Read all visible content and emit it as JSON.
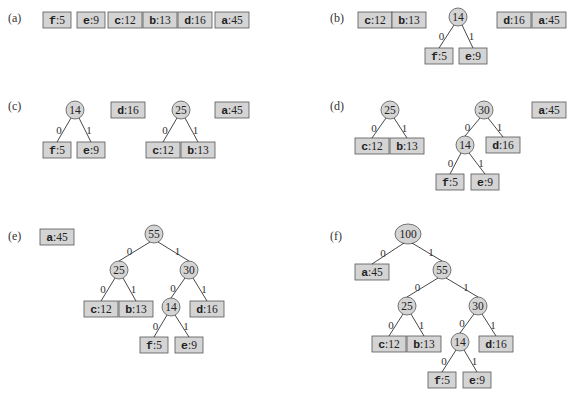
{
  "figure": {
    "panels": [
      {
        "label": "(a)",
        "x": 8,
        "y": 22
      },
      {
        "label": "(b)",
        "x": 330,
        "y": 22
      },
      {
        "label": "(c)",
        "x": 8,
        "y": 110
      },
      {
        "label": "(d)",
        "x": 330,
        "y": 110
      },
      {
        "label": "(e)",
        "x": 8,
        "y": 240
      },
      {
        "label": "(f)",
        "x": 330,
        "y": 240
      }
    ],
    "leaves": {
      "f": {
        "symbol": "f",
        "freq": "5"
      },
      "e": {
        "symbol": "e",
        "freq": "9"
      },
      "c": {
        "symbol": "c",
        "freq": "12"
      },
      "b": {
        "symbol": "b",
        "freq": "13"
      },
      "d": {
        "symbol": "d",
        "freq": "16"
      },
      "a": {
        "symbol": "a",
        "freq": "45"
      }
    },
    "internal_nodes": [
      "14",
      "25",
      "30",
      "55",
      "100"
    ],
    "edge_bits": {
      "left": "0",
      "right": "1"
    }
  }
}
